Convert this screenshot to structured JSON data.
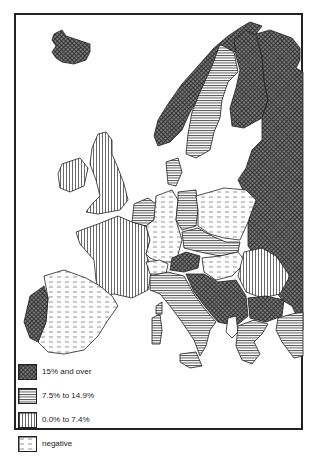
{
  "map": {
    "title": "",
    "region": "Europe",
    "categories": [
      {
        "id": "high",
        "label": "15% and over",
        "pattern": "crosshatch-dark",
        "color": "#555555"
      },
      {
        "id": "mid",
        "label": "7.5% to 14.9%",
        "pattern": "horizontal-lines",
        "color": "#888888"
      },
      {
        "id": "low",
        "label": "0.0% to 7.4%",
        "pattern": "vertical-lines",
        "color": "#bbbbbb"
      },
      {
        "id": "neg",
        "label": "negative",
        "pattern": "dashed",
        "color": "#eeeeee"
      }
    ]
  },
  "legend": {
    "items": [
      {
        "label": "15% and over"
      },
      {
        "label": "7.5% to 14.9%"
      },
      {
        "label": "0.0% to 7.4%"
      },
      {
        "label": "negative"
      }
    ]
  }
}
